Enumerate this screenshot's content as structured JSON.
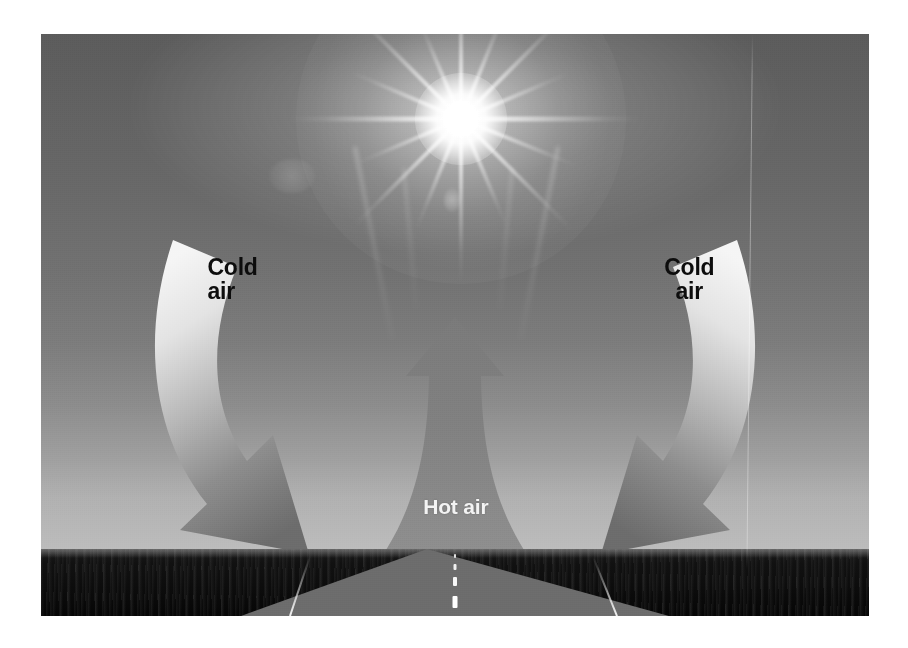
{
  "diagram": {
    "labels": {
      "hot_air": "Hot air",
      "cold_air_left": "Cold\nair",
      "cold_air_right": "Cold\nair"
    },
    "scene": {
      "sun": "sun-starburst",
      "sky": "gradient-gray-sky",
      "ground": "dark-scrubland",
      "road": "straight-asphalt-road-to-vanishing-point"
    },
    "arrows": [
      {
        "name": "hot-air-arrow",
        "direction": "up",
        "label": "Hot air",
        "style": "flared-updraft"
      },
      {
        "name": "cold-air-arrow-left",
        "direction": "down-right",
        "label": "Cold air",
        "style": "curved-descending"
      },
      {
        "name": "cold-air-arrow-right",
        "direction": "down-left",
        "label": "Cold air",
        "style": "curved-descending"
      }
    ],
    "colors": {
      "sky_top": "#5d5d5d",
      "sky_horizon": "#bdbdbd",
      "ground": "#111111",
      "road": "#6e6e6e",
      "arrow_light": "#f2f2f2",
      "arrow_dark": "#6f6f6f",
      "hot_arrow": "#8a8a8a",
      "label_dark": "#0d0d0d",
      "label_light": "#f4f4f4",
      "page_background": "#ffffff"
    }
  }
}
